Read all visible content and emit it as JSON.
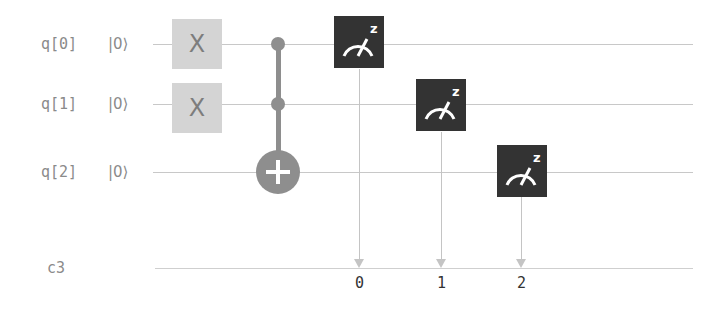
{
  "circuit": {
    "qubits": [
      {
        "label": "q[0]",
        "init": "|0⟩"
      },
      {
        "label": "q[1]",
        "init": "|0⟩"
      },
      {
        "label": "q[2]",
        "init": "|0⟩"
      }
    ],
    "classical_register": {
      "label": "c3",
      "bits": [
        "0",
        "1",
        "2"
      ]
    },
    "gates": [
      {
        "type": "X",
        "qubit": 0,
        "label": "X"
      },
      {
        "type": "X",
        "qubit": 1,
        "label": "X"
      },
      {
        "type": "CCX",
        "controls": [
          0,
          1
        ],
        "target": 2
      },
      {
        "type": "measure",
        "qubit": 0,
        "bit": 0,
        "basis": "z"
      },
      {
        "type": "measure",
        "qubit": 1,
        "bit": 1,
        "basis": "z"
      },
      {
        "type": "measure",
        "qubit": 2,
        "bit": 2,
        "basis": "z"
      }
    ],
    "colors": {
      "wire": "#c8c8c8",
      "x_gate": "#d4d4d4",
      "control": "#8e8e8e",
      "measure": "#333333"
    }
  }
}
